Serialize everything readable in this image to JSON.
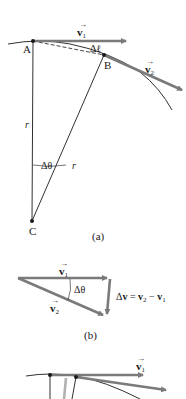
{
  "figure": {
    "panels": [
      {
        "id": "a",
        "caption": "(a)",
        "points": {
          "A": "A",
          "B": "B",
          "C": "C"
        },
        "labels": {
          "v1": "v",
          "v1_sub": "1",
          "v2": "v",
          "v2_sub": "2",
          "arc_length": "Δℓ",
          "radius_left": "r",
          "radius_right": "r",
          "angle": "Δθ"
        }
      },
      {
        "id": "b",
        "caption": "(b)",
        "labels": {
          "v1": "v",
          "v1_sub": "1",
          "v2": "v",
          "v2_sub": "2",
          "angle": "Δθ",
          "delta_v_equation": "Δv = v₂ − v₁",
          "dv_prefix": "Δ",
          "dv_v": "v",
          "dv_eq": " = ",
          "dv_v2": "v",
          "dv_v2_sub": "2",
          "dv_minus": " − ",
          "dv_v1": "v",
          "dv_v1_sub": "1"
        }
      },
      {
        "id": "c",
        "caption": "",
        "labels": {
          "v1": "v",
          "v1_sub": "1"
        }
      }
    ],
    "colors": {
      "line": "#1a1a1a",
      "vector": "#7a7a7a",
      "vector_light": "#b0b0b0",
      "background": "#ffffff"
    }
  }
}
